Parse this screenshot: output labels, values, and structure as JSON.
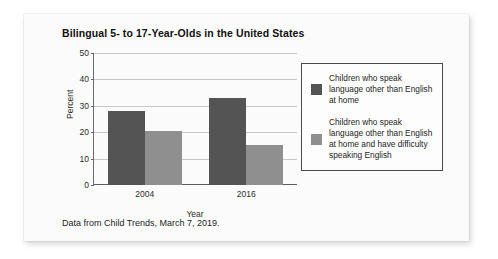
{
  "card": {
    "source_note": "Data from Child Trends, March 7, 2019."
  },
  "chart_data": {
    "type": "bar",
    "title": "Bilingual 5- to 17-Year-Olds in the United States",
    "xlabel": "Year",
    "ylabel": "Percent",
    "categories": [
      "2004",
      "2016"
    ],
    "ylim": [
      0,
      50
    ],
    "yticks": [
      0,
      10,
      20,
      30,
      40,
      50
    ],
    "ytick_labels": [
      "0",
      "10",
      "20",
      "30",
      "40",
      "50"
    ],
    "grid": true,
    "legend_position": "right",
    "series": [
      {
        "name": "Children who speak language other than English at home",
        "color": "#545454",
        "values": [
          28,
          33
        ]
      },
      {
        "name": "Children who speak language other than English at home and have difficulty speaking English",
        "color": "#8f8f8f",
        "values": [
          20.5,
          15
        ]
      }
    ]
  }
}
